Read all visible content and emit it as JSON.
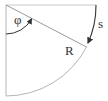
{
  "diagram": {
    "type": "quarter-circle arc geometry",
    "labels": {
      "angle": "φ",
      "arc": "s",
      "radius": "R"
    },
    "colors": {
      "frame": "#b5b5b5",
      "arc_s": "#333333",
      "angle_arc": "#333333",
      "label": "#333333"
    }
  }
}
